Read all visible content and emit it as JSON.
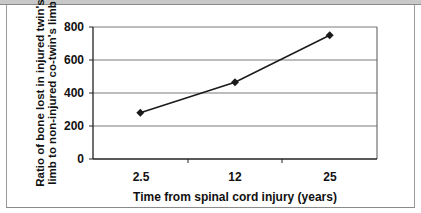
{
  "chart_data": {
    "type": "line",
    "title": "",
    "xlabel": "Time from spinal cord injury (years)",
    "ylabel_line1": "Ratio of bone lost in injured twin's",
    "ylabel_line2": "limb to non-injured co-twin's limb",
    "categories": [
      "2.5",
      "12",
      "25"
    ],
    "series": [
      {
        "name": "Ratio",
        "values": [
          280,
          465,
          750
        ],
        "color": "#1a1a1a",
        "marker": "diamond"
      }
    ],
    "yticks": [
      "0",
      "200",
      "400",
      "600",
      "800"
    ],
    "ylim": [
      0,
      800
    ],
    "grid": true,
    "legend": "none"
  }
}
